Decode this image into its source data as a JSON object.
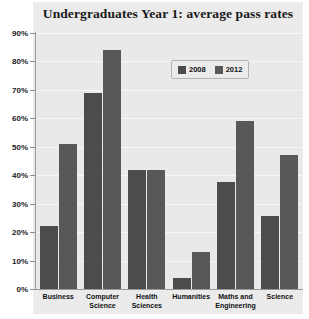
{
  "chart_data": {
    "type": "bar",
    "title": "Undergraduates Year 1: average pass rates",
    "xlabel": "",
    "ylabel": "",
    "ylim": [
      0,
      90
    ],
    "ytick_step": 10,
    "ytick_labels": [
      "90%",
      "80%",
      "70%",
      "60%",
      "50%",
      "40%",
      "30%",
      "20%",
      "10%",
      "0%"
    ],
    "ytick_values": [
      90,
      80,
      70,
      60,
      50,
      40,
      30,
      20,
      10,
      0
    ],
    "grid": true,
    "legend_position": "top-right-inside",
    "categories": [
      "Business",
      "Computer Science",
      "Health Sciences",
      "Humanities",
      "Maths and Engineering",
      "Science"
    ],
    "category_lines": [
      [
        "Business"
      ],
      [
        "Computer",
        "Science"
      ],
      [
        "Health",
        "Sciences"
      ],
      [
        "Humanities"
      ],
      [
        "Maths and",
        "Engineering"
      ],
      [
        "Science"
      ]
    ],
    "series": [
      {
        "name": "2008",
        "color": "#4c4c4c",
        "values": [
          22,
          69,
          42,
          4,
          37.5,
          25.5
        ]
      },
      {
        "name": "2012",
        "color": "#585858",
        "values": [
          51,
          84,
          42,
          13,
          59,
          47
        ]
      }
    ]
  },
  "legend": {
    "entries": [
      {
        "label": "2008"
      },
      {
        "label": "2012"
      }
    ]
  },
  "colors": {
    "panel_background": "#ebebeb",
    "plot_background": "#e9e9e9",
    "gridline": "#f7f7f7",
    "axis": "#9a9a9a",
    "series_2008": "#4c4c4c",
    "series_2012": "#585858",
    "text": "#111111"
  }
}
